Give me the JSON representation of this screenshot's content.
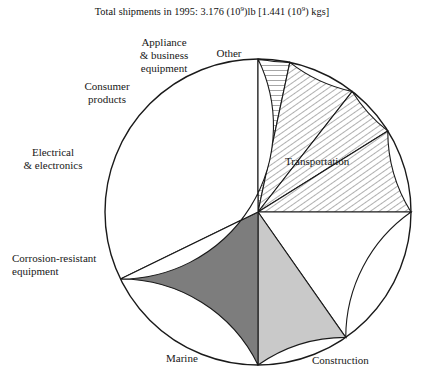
{
  "figure": {
    "title_prefix": "Total shipments in 1995: 3.176 (10",
    "title_exp1": "9",
    "title_mid": ")lb [1.441 (10",
    "title_exp2": "9",
    "title_suffix": ") kgs]",
    "title_full": "Total shipments in 1995: 3.176 (10^9)lb [1.441 (10^9) kgs]"
  },
  "chart_data": {
    "type": "pie",
    "unit": "percent of total shipments",
    "total_label": "3.176 (10^9) lb [1.441 (10^9) kgs]",
    "start_angle_deg": 0,
    "direction": "counterclockwise",
    "legend": "none (direct labels)",
    "categories": [
      "Other",
      "Appliance & business equipment",
      "Consumer products",
      "Electrical & electronics",
      "Corrosion-resistant equipment",
      "Marine",
      "Construction",
      "Transportation"
    ],
    "values": [
      3.3,
      7.2,
      5.6,
      8.9,
      15.3,
      9.7,
      17.8,
      32.2
    ],
    "slices": [
      {
        "label": "Other",
        "label_text": "Other",
        "value": 3.3,
        "start_deg": 0,
        "end_deg": 12,
        "fill": "horizontal-hatch",
        "color": "#ffffff",
        "label_pos": {
          "x": 228,
          "y": 46,
          "align": "center"
        }
      },
      {
        "label": "Appliance & business equipment",
        "label_text": "Appliance\n& business\nequipment",
        "value": 7.2,
        "start_deg": 12,
        "end_deg": 38,
        "fill": "diagonal-hatch",
        "color": "#ffffff",
        "label_pos": {
          "x": 164,
          "y": 29,
          "align": "center"
        }
      },
      {
        "label": "Consumer products",
        "label_text": "Consumer\nproducts",
        "value": 5.6,
        "start_deg": 38,
        "end_deg": 58,
        "fill": "diagonal-hatch",
        "color": "#ffffff",
        "label_pos": {
          "x": 107,
          "y": 80,
          "align": "center"
        }
      },
      {
        "label": "Electrical & electronics",
        "label_text": "Electrical\n& electronics",
        "value": 8.9,
        "start_deg": 58,
        "end_deg": 90,
        "fill": "diagonal-hatch",
        "color": "#ffffff",
        "label_pos": {
          "x": 42,
          "y": 146,
          "align": "center"
        }
      },
      {
        "label": "Corrosion-resistant equipment",
        "label_text": "Corrosion-resistant\nequipment",
        "value": 15.3,
        "start_deg": 90,
        "end_deg": 145,
        "fill": "solid",
        "color": "#ffffff",
        "label_pos": {
          "x": 16,
          "y": 252,
          "align": "left"
        }
      },
      {
        "label": "Marine",
        "label_text": "Marine",
        "value": 9.7,
        "start_deg": 145,
        "end_deg": 180,
        "fill": "solid",
        "color": "#c9c9c9",
        "label_pos": {
          "x": 166,
          "y": 355,
          "align": "left"
        }
      },
      {
        "label": "Construction",
        "label_text": "Construction",
        "value": 17.8,
        "start_deg": 180,
        "end_deg": 244,
        "fill": "solid",
        "color": "#7d7d7d",
        "label_pos": {
          "x": 314,
          "y": 357,
          "align": "left"
        }
      },
      {
        "label": "Transportation",
        "label_text": "Transportation",
        "value": 32.2,
        "start_deg": 244,
        "end_deg": 360,
        "fill": "solid",
        "color": "#ffffff",
        "label_pos": {
          "x": 286,
          "y": 155,
          "align": "left"
        }
      }
    ],
    "geometry": {
      "center_x": 258,
      "center_y": 212,
      "radius": 153
    }
  }
}
